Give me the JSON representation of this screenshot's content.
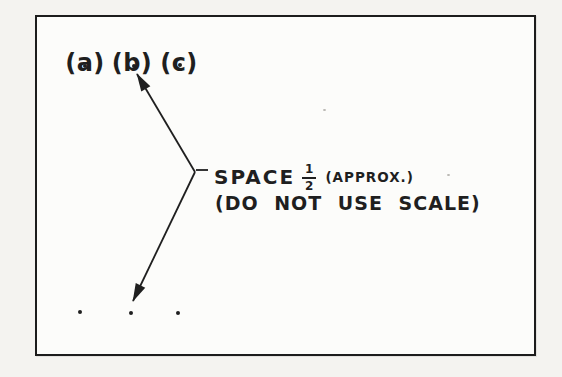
{
  "figure": {
    "point_labels": [
      "(a)",
      "(b)",
      "(c)"
    ],
    "callout": {
      "label_main": "SPACE",
      "fraction": {
        "numerator": "1",
        "denominator": "2"
      },
      "label_approx": "(APPROX.)",
      "note": "(DO NOT USE SCALE)"
    },
    "colors": {
      "ink": "#1f1f1f",
      "paper": "#fcfcfa",
      "page_background": "#f4f3f0"
    }
  }
}
